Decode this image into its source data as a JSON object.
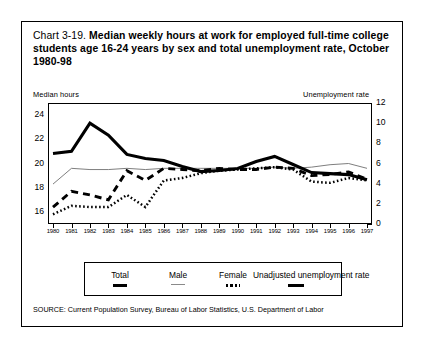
{
  "title": {
    "prefix": "Chart 3-19. ",
    "main": "Median weekly hours at work for employed full-time college students age 16-24 years by sex and total unemployment rate, October 1980-98"
  },
  "axes": {
    "left_header": "Median hours",
    "right_header": "Unemployment rate",
    "left_ticks": [
      "24",
      "22",
      "20",
      "18",
      "16"
    ],
    "right_ticks": [
      "12",
      "10",
      "8",
      "6",
      "4",
      "2",
      "0"
    ]
  },
  "legend": {
    "items": [
      {
        "label": "Total",
        "style": "thick-dash"
      },
      {
        "label": "Male",
        "style": "thin-line"
      },
      {
        "label": "Female",
        "style": "dotted"
      },
      {
        "label": "Unadjusted unemployment rate",
        "style": "thick-dash"
      }
    ]
  },
  "source": "SOURCE: Current Population Survey, Bureau of Labor Statistics, U.S. Department of Labor",
  "chart_data": {
    "type": "line",
    "title": "Chart 3-19. Median weekly hours at work for employed full-time college students age 16-24 years by sex and total unemployment rate, October 1980-98",
    "xlabel": "",
    "ylabel": "Median hours",
    "y2label": "Unemployment rate",
    "ylim": [
      15,
      25
    ],
    "y2lim": [
      0,
      12
    ],
    "ygrid": false,
    "legend_position": "bottom",
    "x": [
      "1980",
      "1981",
      "1982",
      "1983",
      "1984",
      "1985",
      "1986",
      "1987",
      "1988",
      "1989",
      "1990",
      "1991",
      "1992",
      "1993",
      "1994",
      "1995",
      "1996",
      "1997"
    ],
    "series": [
      {
        "name": "Total",
        "axis": "left",
        "style": "thin-line",
        "values": [
          18.3,
          19.6,
          19.5,
          19.5,
          19.6,
          19.5,
          19.6,
          19.6,
          19.6,
          19.6,
          19.6,
          19.6,
          19.7,
          19.6,
          19.7,
          19.9,
          20.0,
          19.6
        ]
      },
      {
        "name": "Male",
        "axis": "left",
        "style": "dashed",
        "values": [
          16.4,
          17.7,
          17.4,
          17.0,
          19.4,
          18.6,
          19.6,
          19.5,
          19.4,
          19.6,
          19.5,
          19.5,
          19.7,
          19.6,
          19.0,
          19.1,
          19.3,
          18.7
        ]
      },
      {
        "name": "Female",
        "axis": "left",
        "style": "dotted",
        "values": [
          15.8,
          16.5,
          16.4,
          16.4,
          17.4,
          16.4,
          18.6,
          18.8,
          19.2,
          19.4,
          19.5,
          19.6,
          19.7,
          19.5,
          18.5,
          18.4,
          18.8,
          18.6
        ]
      },
      {
        "name": "Unadjusted unemployment rate",
        "axis": "right",
        "style": "thick-line",
        "values": [
          7.0,
          7.2,
          10.0,
          8.8,
          6.9,
          6.5,
          6.3,
          5.7,
          5.2,
          5.3,
          5.5,
          6.2,
          6.7,
          5.9,
          5.1,
          5.0,
          4.9,
          4.4
        ]
      }
    ]
  }
}
